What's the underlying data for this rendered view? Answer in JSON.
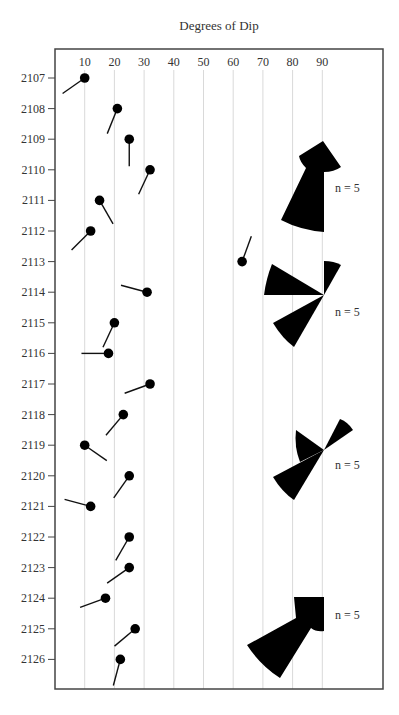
{
  "chart_data": {
    "type": "scatter",
    "subtype": "tadpole-plot-with-rose-diagrams",
    "title": "Degrees of Dip",
    "xlabel": "Degrees of Dip",
    "ylabel": "Depth",
    "xlim": [
      0,
      100
    ],
    "x_ticks": [
      10,
      20,
      30,
      40,
      50,
      60,
      70,
      80,
      90
    ],
    "y_ticks": [
      2107,
      2108,
      2109,
      2110,
      2111,
      2112,
      2113,
      2114,
      2115,
      2116,
      2117,
      2118,
      2119,
      2120,
      2121,
      2122,
      2123,
      2124,
      2125,
      2126
    ],
    "grid": "vertical",
    "tadpoles": [
      {
        "depth": 2107,
        "dip": 10,
        "azimuth": 235
      },
      {
        "depth": 2108,
        "dip": 21,
        "azimuth": 202
      },
      {
        "depth": 2109,
        "dip": 25,
        "azimuth": 180
      },
      {
        "depth": 2110,
        "dip": 32,
        "azimuth": 205
      },
      {
        "depth": 2111,
        "dip": 15,
        "azimuth": 150
      },
      {
        "depth": 2112,
        "dip": 12,
        "azimuth": 225
      },
      {
        "depth": 2113,
        "dip": 63,
        "azimuth": 20
      },
      {
        "depth": 2114,
        "dip": 31,
        "azimuth": 285
      },
      {
        "depth": 2115,
        "dip": 20,
        "azimuth": 205
      },
      {
        "depth": 2116,
        "dip": 18,
        "azimuth": 270
      },
      {
        "depth": 2117,
        "dip": 32,
        "azimuth": 250
      },
      {
        "depth": 2118,
        "dip": 23,
        "azimuth": 220
      },
      {
        "depth": 2119,
        "dip": 10,
        "azimuth": 125
      },
      {
        "depth": 2120,
        "dip": 25,
        "azimuth": 215
      },
      {
        "depth": 2121,
        "dip": 12,
        "azimuth": 285
      },
      {
        "depth": 2122,
        "dip": 25,
        "azimuth": 210
      },
      {
        "depth": 2123,
        "dip": 25,
        "azimuth": 235
      },
      {
        "depth": 2124,
        "dip": 17,
        "azimuth": 250
      },
      {
        "depth": 2125,
        "dip": 27,
        "azimuth": 230
      },
      {
        "depth": 2126,
        "dip": 22,
        "azimuth": 195
      }
    ],
    "rose_diagrams": [
      {
        "label": "n = 5",
        "depth_range": [
          2107,
          2112
        ]
      },
      {
        "label": "n = 5",
        "depth_range": [
          2113,
          2117
        ]
      },
      {
        "label": "n = 5",
        "depth_range": [
          2118,
          2122
        ]
      },
      {
        "label": "n = 5",
        "depth_range": [
          2123,
          2126
        ]
      }
    ]
  }
}
